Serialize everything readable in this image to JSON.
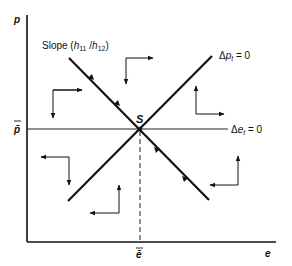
{
  "diagram": {
    "type": "phase-diagram",
    "colors": {
      "ink": "#111111",
      "background": "#ffffff"
    },
    "axes": {
      "y_label": "p",
      "x_label": "e",
      "y_equilibrium_label": "p̄",
      "x_equilibrium_label": "ē"
    },
    "curves": {
      "saddle_path_label_prefix": "Slope (",
      "saddle_path_label_h11": "h",
      "saddle_path_label_h11_sub": "11",
      "saddle_path_label_slash": " /",
      "saddle_path_label_h12": "h",
      "saddle_path_label_h12_sub": "12",
      "saddle_path_label_suffix": ")",
      "delta_p_label_delta": "Δ",
      "delta_p_label_var": "p",
      "delta_p_label_sub": "t",
      "delta_p_label_eq": " = 0",
      "delta_e_label_delta": "Δ",
      "delta_e_label_var": "e",
      "delta_e_label_sub": "t",
      "delta_e_label_eq": " = 0"
    },
    "equilibrium_point_label": "S",
    "direction_arrows": [
      {
        "region": "upper-left",
        "horizontal": "right",
        "vertical": "down"
      },
      {
        "region": "upper-middle",
        "horizontal": "right",
        "vertical": "down"
      },
      {
        "region": "upper-right",
        "horizontal": "right",
        "vertical": "up"
      },
      {
        "region": "lower-left",
        "horizontal": "left",
        "vertical": "down"
      },
      {
        "region": "lower-middle",
        "horizontal": "left",
        "vertical": "up"
      },
      {
        "region": "lower-right",
        "horizontal": "left",
        "vertical": "up"
      }
    ]
  }
}
